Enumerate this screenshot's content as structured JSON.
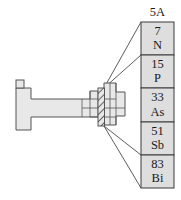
{
  "figure": {
    "background_color": "#ffffff"
  },
  "colors": {
    "cell_fill": "#dedede",
    "table_fill": "#e8e8e8",
    "outline": "#555555",
    "cell_outline": "#3a3a3a",
    "leader_line": "#4a4a4a",
    "hatch": "#4a4a4a",
    "text": "#1a1a1a"
  },
  "callout": {
    "group_label": "5A",
    "elements": [
      {
        "atomic_number": "7",
        "symbol": "N"
      },
      {
        "atomic_number": "15",
        "symbol": "P"
      },
      {
        "atomic_number": "33",
        "symbol": "As"
      },
      {
        "atomic_number": "51",
        "symbol": "Sb"
      },
      {
        "atomic_number": "83",
        "symbol": "Bi"
      }
    ]
  },
  "periodic_table": {
    "highlighted_group": "5A",
    "highlight_style": "diagonal-hatch"
  }
}
